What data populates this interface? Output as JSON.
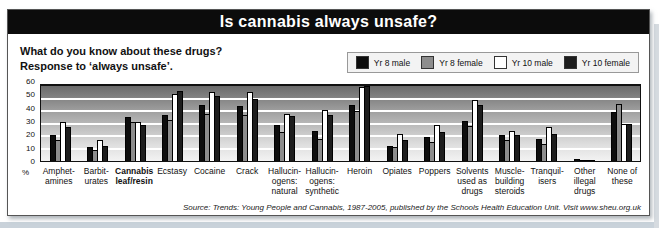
{
  "page": {
    "title": "Is cannabis always unsafe?",
    "question_line1": "What do you know about these drugs?",
    "question_line2": "Response to ‘always unsafe’.",
    "source": "Source: Trends: Young People and Cannabis, 1987-2005, published by the Schools Health Education Unit. Visit www.sheu.org.uk"
  },
  "chart_data": {
    "type": "bar",
    "title": "Is cannabis always unsafe?",
    "xlabel": "",
    "ylabel": "%",
    "unit_label": "%",
    "ylim": [
      0,
      60
    ],
    "yticks": [
      0,
      10,
      20,
      30,
      40,
      50,
      60
    ],
    "grid": true,
    "legend_position": "top-right",
    "plot_background": "gray gradient, dark at top",
    "bold_category_index": 2,
    "categories": [
      "Amphet-\namines",
      "Barbit-\nurates",
      "Cannabis\nleaf/resin",
      "Ecstasy",
      "Cocaine",
      "Crack",
      "Hallucin-\nogens:\nnatural",
      "Hallucin-\nogens:\nsynthetic",
      "Heroin",
      "Opiates",
      "Poppers",
      "Solvents\nused as\ndrugs",
      "Muscle-\nbuilding\nsteroids",
      "Tranquil-\nisers",
      "Other\nillegal\ndrugs",
      "None of\nthese"
    ],
    "series": [
      {
        "name": "Yr 8 male",
        "color": "#0d0d0d",
        "values": [
          21,
          11,
          35,
          37,
          45,
          44,
          29,
          24,
          45,
          12,
          19,
          32,
          21,
          18,
          2,
          39
        ]
      },
      {
        "name": "Yr 8 female",
        "color": "#8d8d8d",
        "values": [
          17,
          9,
          31,
          33,
          38,
          37,
          23,
          18,
          40,
          11,
          15,
          28,
          17,
          14,
          1,
          46
        ]
      },
      {
        "name": "Yr 10 male",
        "color": "#ffffff",
        "values": [
          31,
          17,
          31,
          54,
          55,
          55,
          38,
          41,
          59,
          22,
          29,
          49,
          24,
          27,
          1,
          30
        ]
      },
      {
        "name": "Yr 10 female",
        "color": "#1d1d1d",
        "values": [
          27,
          12,
          29,
          56,
          52,
          50,
          36,
          37,
          60,
          17,
          23,
          45,
          21,
          22,
          1,
          30
        ]
      }
    ]
  }
}
